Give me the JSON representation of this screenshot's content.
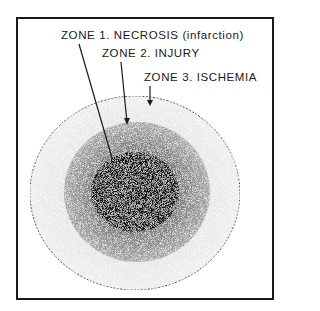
{
  "diagram": {
    "type": "concentric-zones",
    "labels": [
      {
        "zone": 1,
        "text": "ZONE 1.  NECROSIS (infarction)"
      },
      {
        "zone": 2,
        "text": "ZONE 2.  INJURY"
      },
      {
        "zone": 3,
        "text": "ZONE 3.  ISCHEMIA"
      }
    ],
    "colors": {
      "frame": "#1a1a1a",
      "necrosis": "#151515",
      "injury": "#8a8a8a",
      "ischemia": "#e6e6e6",
      "background": "#ffffff"
    }
  }
}
